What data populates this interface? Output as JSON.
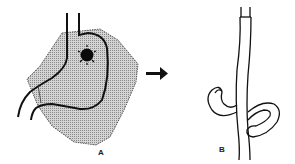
{
  "figure": {
    "panels": [
      {
        "id": "A",
        "label": "A",
        "description": "Stomach with shaded irregular region and dark spot"
      },
      {
        "id": "B",
        "label": "B",
        "description": "Tube with looped/knotted segment"
      }
    ],
    "arrow": {
      "direction": "right",
      "meaning": "transformation from A to B"
    },
    "colors": {
      "ink": "#111111",
      "shade": "#bdbdbd",
      "background": "#ffffff"
    }
  }
}
